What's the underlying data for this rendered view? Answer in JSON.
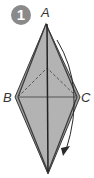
{
  "step": {
    "number": "1"
  },
  "vertices": {
    "a": "A",
    "b": "B",
    "c": "C"
  },
  "colors": {
    "badge": "#8a8a8a",
    "paper_fill": "#b3b3b3",
    "outline": "#3a3a3a",
    "arrow": "#2a2a2a"
  }
}
